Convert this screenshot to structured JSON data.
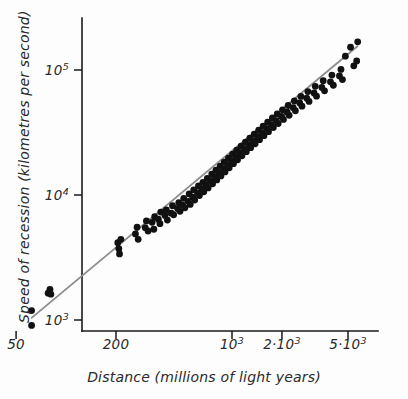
{
  "chart_data": {
    "type": "scatter",
    "title": "",
    "xlabel": "Distance (millions of light years)",
    "ylabel": "Speed of recession (kilometres per second)",
    "xscale": "log",
    "yscale": "log",
    "xlim": [
      50,
      6500
    ],
    "ylim": [
      800,
      260000
    ],
    "grid": false,
    "legend": null,
    "xticks": [
      {
        "value": 50,
        "label_main": "50",
        "label_exp": ""
      },
      {
        "value": 200,
        "label_main": "200",
        "label_exp": ""
      },
      {
        "value": 1000,
        "label_main": "10",
        "label_exp": "3"
      },
      {
        "value": 2000,
        "label_main": "2·10",
        "label_exp": "3"
      },
      {
        "value": 5000,
        "label_main": "5·10",
        "label_exp": "3"
      }
    ],
    "yticks": [
      {
        "value": 1000,
        "label_main": "10",
        "label_exp": "3"
      },
      {
        "value": 10000,
        "label_main": "10",
        "label_exp": "4"
      },
      {
        "value": 100000,
        "label_main": "10",
        "label_exp": "5"
      }
    ],
    "fit_line": {
      "name": "Hubble law fit",
      "color": "#8d8d8d",
      "x_start": 62,
      "y_start": 1040,
      "x_end": 5700,
      "y_end": 155000
    },
    "point_color": "#111111",
    "point_radius": 3.4,
    "points": [
      [
        62,
        1190
      ],
      [
        62,
        905
      ],
      [
        78,
        1640
      ],
      [
        80,
        1760
      ],
      [
        81,
        1610
      ],
      [
        205,
        4150
      ],
      [
        208,
        3720
      ],
      [
        210,
        3380
      ],
      [
        214,
        4420
      ],
      [
        262,
        4880
      ],
      [
        268,
        5520
      ],
      [
        272,
        4420
      ],
      [
        300,
        5480
      ],
      [
        305,
        6200
      ],
      [
        312,
        5150
      ],
      [
        330,
        6050
      ],
      [
        338,
        5320
      ],
      [
        342,
        6700
      ],
      [
        360,
        6400
      ],
      [
        368,
        5900
      ],
      [
        372,
        7300
      ],
      [
        395,
        6850
      ],
      [
        402,
        7600
      ],
      [
        408,
        6300
      ],
      [
        430,
        7150
      ],
      [
        438,
        8200
      ],
      [
        445,
        6950
      ],
      [
        470,
        7800
      ],
      [
        478,
        8700
      ],
      [
        486,
        7400
      ],
      [
        505,
        8300
      ],
      [
        512,
        9400
      ],
      [
        520,
        7900
      ],
      [
        545,
        8900
      ],
      [
        552,
        10200
      ],
      [
        560,
        8400
      ],
      [
        580,
        9600
      ],
      [
        588,
        11000
      ],
      [
        596,
        9100
      ],
      [
        620,
        10400
      ],
      [
        628,
        11800
      ],
      [
        636,
        9900
      ],
      [
        660,
        11200
      ],
      [
        668,
        12600
      ],
      [
        676,
        10600
      ],
      [
        700,
        12100
      ],
      [
        710,
        13600
      ],
      [
        718,
        11400
      ],
      [
        745,
        13000
      ],
      [
        755,
        14700
      ],
      [
        764,
        12300
      ],
      [
        790,
        14000
      ],
      [
        800,
        15800
      ],
      [
        810,
        13200
      ],
      [
        838,
        15100
      ],
      [
        848,
        17000
      ],
      [
        858,
        14200
      ],
      [
        888,
        16200
      ],
      [
        898,
        18300
      ],
      [
        908,
        15300
      ],
      [
        940,
        17500
      ],
      [
        952,
        19700
      ],
      [
        962,
        16500
      ],
      [
        995,
        18800
      ],
      [
        1008,
        21200
      ],
      [
        1020,
        17800
      ],
      [
        1055,
        20300
      ],
      [
        1068,
        22800
      ],
      [
        1080,
        19100
      ],
      [
        1120,
        21800
      ],
      [
        1134,
        24600
      ],
      [
        1148,
        20600
      ],
      [
        1190,
        23500
      ],
      [
        1205,
        26500
      ],
      [
        1220,
        22200
      ],
      [
        1265,
        25300
      ],
      [
        1280,
        28500
      ],
      [
        1296,
        23900
      ],
      [
        1345,
        27200
      ],
      [
        1362,
        30700
      ],
      [
        1378,
        25700
      ],
      [
        1430,
        29300
      ],
      [
        1448,
        33000
      ],
      [
        1465,
        27700
      ],
      [
        1520,
        31500
      ],
      [
        1540,
        35600
      ],
      [
        1558,
        29800
      ],
      [
        1620,
        34000
      ],
      [
        1640,
        38300
      ],
      [
        1660,
        32100
      ],
      [
        1730,
        36600
      ],
      [
        1752,
        41300
      ],
      [
        1774,
        34600
      ],
      [
        1850,
        39400
      ],
      [
        1874,
        44500
      ],
      [
        1898,
        37300
      ],
      [
        1990,
        42500
      ],
      [
        2016,
        48000
      ],
      [
        2042,
        40200
      ],
      [
        2150,
        46000
      ],
      [
        2180,
        52000
      ],
      [
        2210,
        43400
      ],
      [
        2340,
        50000
      ],
      [
        2375,
        56500
      ],
      [
        2410,
        47200
      ],
      [
        2560,
        54500
      ],
      [
        2600,
        61500
      ],
      [
        2640,
        51400
      ],
      [
        2820,
        59500
      ],
      [
        2866,
        67200
      ],
      [
        2912,
        56100
      ],
      [
        3120,
        65500
      ],
      [
        3175,
        74000
      ],
      [
        3230,
        61700
      ],
      [
        3480,
        72500
      ],
      [
        3545,
        82000
      ],
      [
        3610,
        68200
      ],
      [
        3920,
        80500
      ],
      [
        4000,
        91000
      ],
      [
        4080,
        75500
      ],
      [
        4440,
        89500
      ],
      [
        4535,
        101000
      ],
      [
        4630,
        83800
      ],
      [
        4820,
        129000
      ],
      [
        5180,
        152000
      ],
      [
        5420,
        108000
      ],
      [
        5720,
        168000
      ],
      [
        5640,
        118000
      ]
    ]
  }
}
